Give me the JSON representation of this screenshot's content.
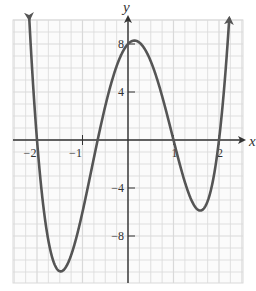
{
  "chart_data": {
    "type": "line",
    "title": "",
    "xlabel": "x",
    "ylabel": "y",
    "function": "f(x) = (x+2)(3x+2)(x-1)(x-2)",
    "xlim": [
      -2.5,
      2.5
    ],
    "ylim": [
      -12,
      10
    ],
    "grid": true,
    "grid_step_x": 0.25,
    "grid_step_y": 1,
    "x_ticks": [
      {
        "value": -2,
        "label": "−2"
      },
      {
        "value": -1,
        "label": "−1"
      },
      {
        "value": 1,
        "label": "1"
      },
      {
        "value": 2,
        "label": "2"
      }
    ],
    "y_ticks": [
      {
        "value": 8,
        "label": "8"
      },
      {
        "value": 4,
        "label": "4"
      },
      {
        "value": -4,
        "label": "−4"
      },
      {
        "value": -8,
        "label": "−8"
      }
    ],
    "key_points": {
      "x_intercepts": [
        -2,
        -0.667,
        1,
        2
      ],
      "y_intercept": 8,
      "local_min_left": {
        "x": -1.5,
        "y": -10.9
      },
      "local_max": {
        "x": 0.1,
        "y": 8.2
      },
      "local_min_right": {
        "x": 1.57,
        "y": -5.9
      }
    },
    "series": [
      {
        "name": "f(x)",
        "color": "#555555",
        "end_arrows": true
      }
    ]
  },
  "colors": {
    "curve": "#555555",
    "axis": "#333333",
    "grid": "#d9d9d9",
    "background": "#ffffff"
  }
}
